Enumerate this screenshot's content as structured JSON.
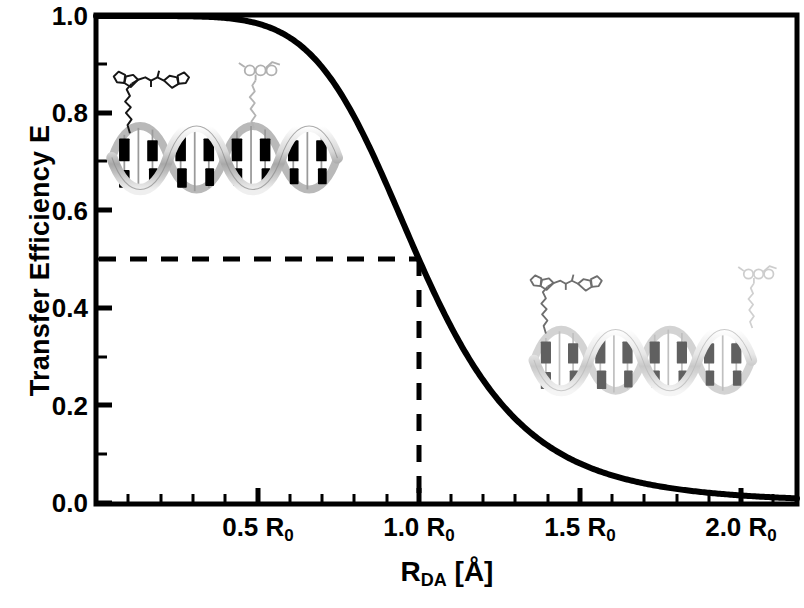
{
  "chart_data": {
    "type": "line",
    "title": "",
    "xlabel": "R_DA [Å]",
    "ylabel": "Transfer Efficiency E",
    "xlim": [
      0.0,
      2.17
    ],
    "ylim": [
      0.0,
      1.0
    ],
    "grid": false,
    "legend": "none",
    "equation": "E = 1 / (1 + (R_DA / R_0)^6)",
    "x_unit": "R_0",
    "x_ticklabels": [
      "0.5 R₀",
      "1.0 R₀",
      "1.5 R₀",
      "2.0 R₀"
    ],
    "x_tickvalues": [
      0.5,
      1.0,
      1.5,
      2.0
    ],
    "x_minor_tick_step": 0.1,
    "y_ticklabels": [
      "0.0",
      "0.2",
      "0.4",
      "0.6",
      "0.8",
      "1.0"
    ],
    "y_tickvalues": [
      0.0,
      0.2,
      0.4,
      0.6,
      0.8,
      1.0
    ],
    "y_minor_tick_step": 0.1,
    "series": [
      {
        "name": "FRET efficiency",
        "color": "#000000",
        "linewidth": 6,
        "x": [
          0.0,
          0.1,
          0.2,
          0.3,
          0.4,
          0.5,
          0.55,
          0.6,
          0.65,
          0.7,
          0.75,
          0.8,
          0.85,
          0.9,
          0.95,
          1.0,
          1.05,
          1.1,
          1.15,
          1.2,
          1.25,
          1.3,
          1.35,
          1.4,
          1.45,
          1.5,
          1.6,
          1.7,
          1.8,
          1.9,
          2.0,
          2.1,
          2.17
        ],
        "y": [
          1.0,
          1.0,
          1.0,
          0.999,
          0.996,
          0.985,
          0.973,
          0.956,
          0.93,
          0.893,
          0.843,
          0.793,
          0.709,
          0.653,
          0.57,
          0.5,
          0.429,
          0.363,
          0.304,
          0.251,
          0.207,
          0.169,
          0.138,
          0.113,
          0.092,
          0.081,
          0.055,
          0.038,
          0.027,
          0.019,
          0.015,
          0.011,
          0.009
        ]
      }
    ],
    "annotations": [
      {
        "name": "half-efficiency-guide",
        "type": "dashed-lines",
        "description": "Dashed horizontal line at E = 0.5 meeting dashed vertical line at R_DA = 1.0 R_0",
        "h_value": 0.5,
        "v_value": 1.0,
        "h_label": "0.5",
        "v_label": "1.0 R₀"
      }
    ]
  },
  "illustrations": [
    {
      "name": "dna-donor-acceptor-close",
      "caption": "DNA duplex with donor and acceptor dyes attached close together (high FRET)",
      "position": "upper-left"
    },
    {
      "name": "dna-donor-acceptor-far",
      "caption": "DNA duplex with donor and acceptor dyes attached at opposite ends (low FRET)",
      "position": "lower-right"
    }
  ],
  "axis": {
    "frame_color": "#000000",
    "frame_width": 5,
    "background": "#ffffff"
  }
}
